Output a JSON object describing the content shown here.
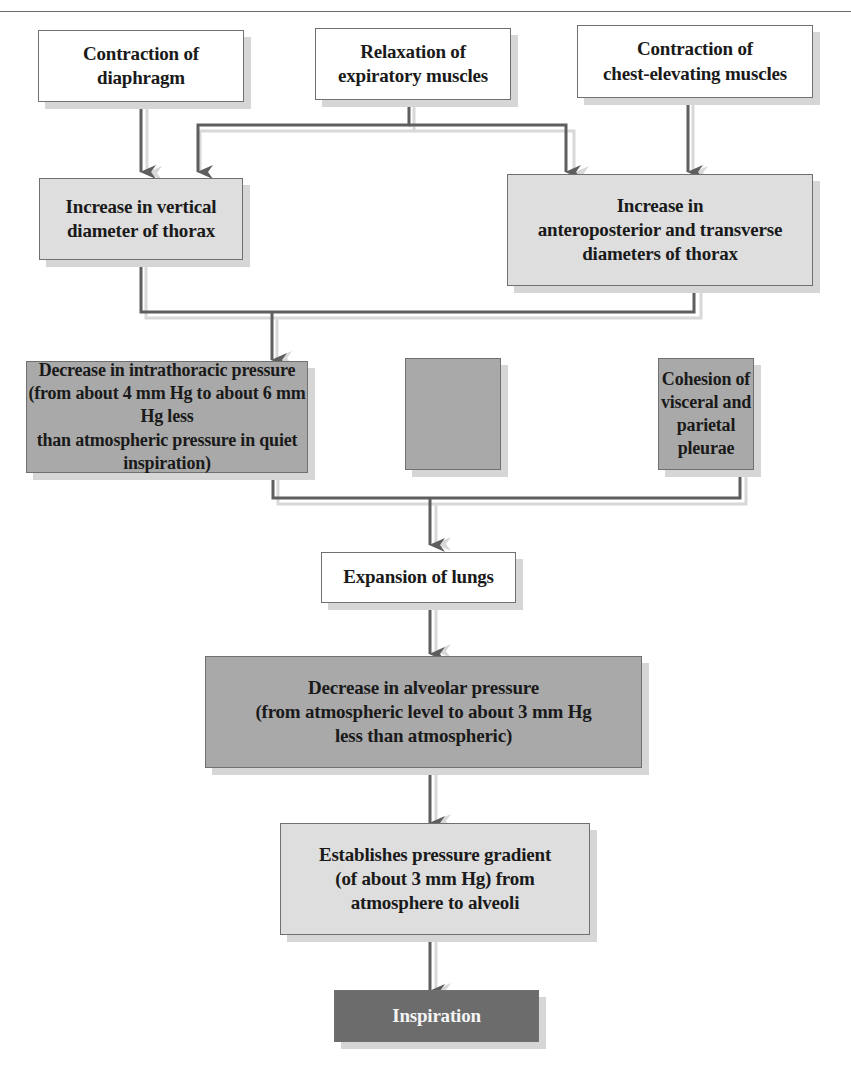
{
  "diagram": {
    "title": "",
    "colors": {
      "white_box": "#ffffff",
      "light_box": "#dedede",
      "medium_box": "#a9a9a9",
      "dark_box": "#6c6c6c",
      "arrow": "#5e5e5e",
      "shadow": "#d6d6d6"
    },
    "nodes": {
      "contraction_diaphragm": {
        "label": "Contraction of\ndiaphragm"
      },
      "relaxation_expiratory": {
        "label": "Relaxation of\nexpiratory muscles"
      },
      "contraction_chest": {
        "label": "Contraction of\nchest-elevating muscles"
      },
      "increase_vertical": {
        "label": "Increase in vertical\ndiameter of thorax"
      },
      "increase_ap_transverse": {
        "label": "Increase in\nanteroposterior and transverse\ndiameters of thorax"
      },
      "decrease_intrathoracic": {
        "label": "Decrease in intrathoracic pressure\n(from about 4 mm Hg to about 6 mm Hg less\nthan atmospheric pressure in quiet inspiration)"
      },
      "cohesion_pleurae": {
        "label": "Cohesion of\nvisceral and\nparietal pleurae"
      },
      "expansion_lungs": {
        "label": "Expansion of lungs"
      },
      "decrease_alveolar": {
        "label": "Decrease in alveolar pressure\n(from atmospheric level to about 3 mm Hg\nless than atmospheric)"
      },
      "pressure_gradient": {
        "label": "Establishes pressure gradient\n(of about 3 mm Hg) from\natmosphere to alveoli"
      },
      "inspiration": {
        "label": "Inspiration"
      }
    },
    "edges": [
      {
        "from": "contraction_diaphragm",
        "to": "increase_vertical"
      },
      {
        "from": "relaxation_expiratory",
        "to": "increase_vertical"
      },
      {
        "from": "relaxation_expiratory",
        "to": "increase_ap_transverse"
      },
      {
        "from": "contraction_chest",
        "to": "increase_ap_transverse"
      },
      {
        "from": "increase_vertical",
        "to": "decrease_intrathoracic"
      },
      {
        "from": "increase_ap_transverse",
        "to": "decrease_intrathoracic"
      },
      {
        "from": "decrease_intrathoracic",
        "to": "expansion_lungs"
      },
      {
        "from": "cohesion_pleurae",
        "to": "expansion_lungs"
      },
      {
        "from": "expansion_lungs",
        "to": "decrease_alveolar"
      },
      {
        "from": "decrease_alveolar",
        "to": "pressure_gradient"
      },
      {
        "from": "pressure_gradient",
        "to": "inspiration"
      }
    ]
  }
}
